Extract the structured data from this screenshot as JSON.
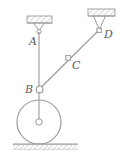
{
  "figure": {
    "name": "pulley-linkage-diagram",
    "background": "#ffffff",
    "stroke_color": "#9a9a9a",
    "label_color": "#5a5a5a",
    "hatch_color": "#b0b0b0",
    "width": 127,
    "height": 160
  },
  "labels": {
    "a": "A",
    "b": "B",
    "c": "C",
    "d": "D"
  },
  "points": {
    "A": {
      "x": 39,
      "y": 31,
      "joint": "pin-support-circle"
    },
    "B": {
      "x": 39,
      "y": 89,
      "joint": "pin-circle"
    },
    "C": {
      "x": 68,
      "y": 58,
      "joint": "pin-square"
    },
    "D": {
      "x": 99,
      "y": 31,
      "joint": "pin-square"
    },
    "wheel_center": {
      "x": 39,
      "y": 122
    }
  },
  "geometry": {
    "wheel_radius": 22,
    "hub_radius": 3.2,
    "ground_y": 144,
    "support_a_plate": {
      "x": 27,
      "y": 16,
      "w": 25,
      "h": 7
    },
    "support_d_plate": {
      "x": 88,
      "y": 9,
      "w": 27,
      "h": 7
    }
  },
  "members": {
    "ab": "A-B vertical bar",
    "bd": "B-C-D inclined bar",
    "b_hub": "B to wheel hub link"
  }
}
